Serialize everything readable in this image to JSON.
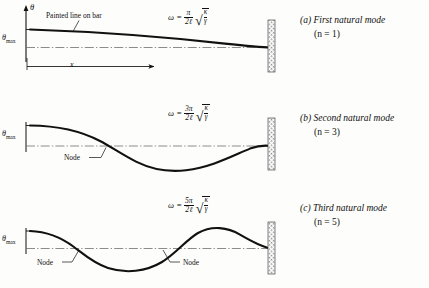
{
  "figure": {
    "background": "#fdfdfb",
    "ink": "#111111",
    "axis_symbol": "θ",
    "amplitude_label": "θ",
    "amplitude_sub": "max",
    "distance_label": "x",
    "painted_line_label": "Painted line on bar",
    "node_label": "Node"
  },
  "panels": [
    {
      "id": "a",
      "tag": "(a)",
      "caption": "First natural mode",
      "mode_number_text": "(n = 1)",
      "n": 1,
      "formula": {
        "omega": "ω",
        "equals": "=",
        "numerator": "π",
        "denominator": "2ℓ",
        "radical_numerator": "κ",
        "radical_denominator": "γ",
        "plain": "ω = (π/2ℓ)√(κ/γ)"
      },
      "nodes": 0,
      "node_labels": [],
      "shows_painted_line_label": true,
      "shows_x_arrow": true
    },
    {
      "id": "b",
      "tag": "(b)",
      "caption": "Second natural mode",
      "mode_number_text": "(n = 3)",
      "n": 3,
      "formula": {
        "omega": "ω",
        "equals": "=",
        "numerator": "3π",
        "denominator": "2ℓ",
        "radical_numerator": "κ",
        "radical_denominator": "γ",
        "plain": "ω = (3π/2ℓ)√(κ/γ)"
      },
      "nodes": 1,
      "node_labels": [
        "Node"
      ],
      "shows_painted_line_label": false,
      "shows_x_arrow": false
    },
    {
      "id": "c",
      "tag": "(c)",
      "caption": "Third natural mode",
      "mode_number_text": "(n = 5)",
      "n": 5,
      "formula": {
        "omega": "ω",
        "equals": "=",
        "numerator": "5π",
        "denominator": "2ℓ",
        "radical_numerator": "κ",
        "radical_denominator": "γ",
        "plain": "ω = (5π/2ℓ)√(κ/γ)"
      },
      "nodes": 2,
      "node_labels": [
        "Node",
        "Node"
      ],
      "shows_painted_line_label": false,
      "shows_x_arrow": false
    }
  ]
}
